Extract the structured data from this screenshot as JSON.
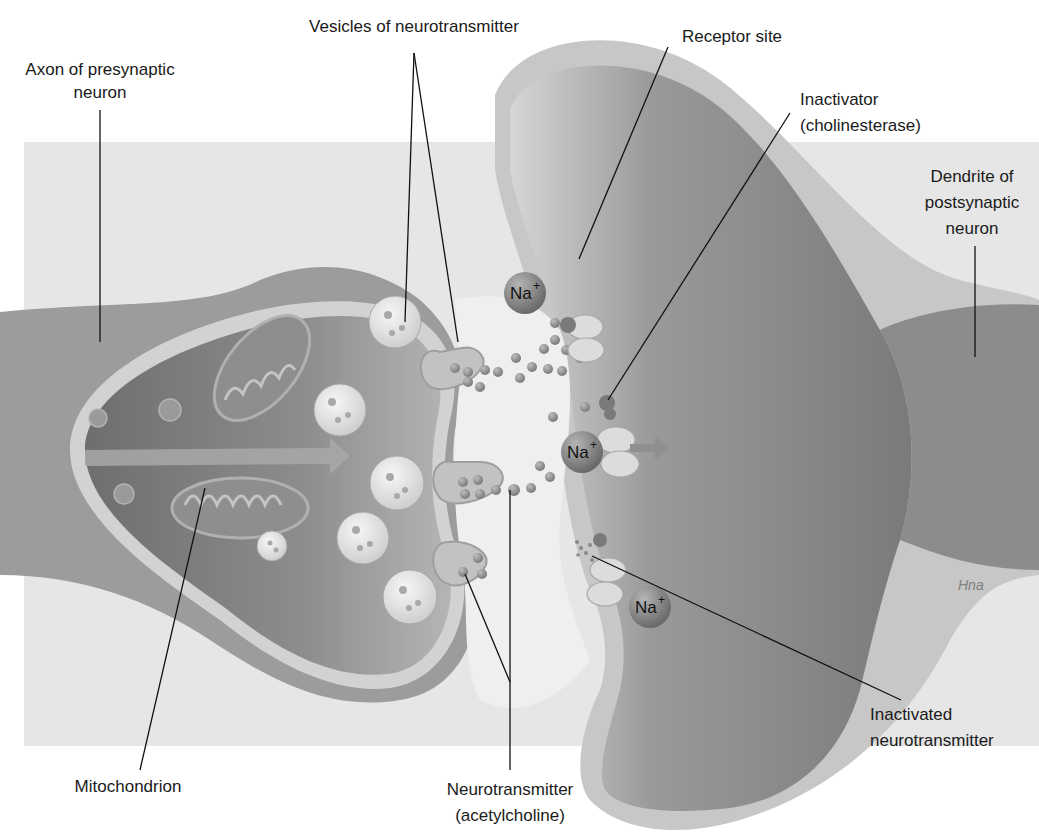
{
  "diagram": {
    "labels": {
      "axon_line1": "Axon of presynaptic",
      "axon_line2": "neuron",
      "vesicles": "Vesicles of neurotransmitter",
      "receptor": "Receptor site",
      "inactivator_line1": "Inactivator",
      "inactivator_line2": "(cholinesterase)",
      "dendrite_line1": "Dendrite of",
      "dendrite_line2": "postsynaptic",
      "dendrite_line3": "neuron",
      "mitochondrion": "Mitochondrion",
      "neurotransmitter_line1": "Neurotransmitter",
      "neurotransmitter_line2": "(acetylcholine)",
      "inactivated_line1": "Inactivated",
      "inactivated_line2": "neurotransmitter"
    },
    "ions": {
      "symbol": "Na",
      "charge": "+"
    },
    "signature": "Hna",
    "colors": {
      "background_band": "#e6e6e6",
      "axon_body": "#9c9c9c",
      "axon_interior": "#7a7a7a",
      "membrane": "#c9c9c9",
      "dendrite_body": "#888888",
      "dendrite_interior": "#7b7b7b",
      "cleft": "#efefef",
      "vesicle": "#e4e4e4",
      "particle": "#8c8c8c",
      "ion": "#8a8a8a",
      "receptor": "#dcdcdc",
      "leader_line": "#111111"
    }
  }
}
